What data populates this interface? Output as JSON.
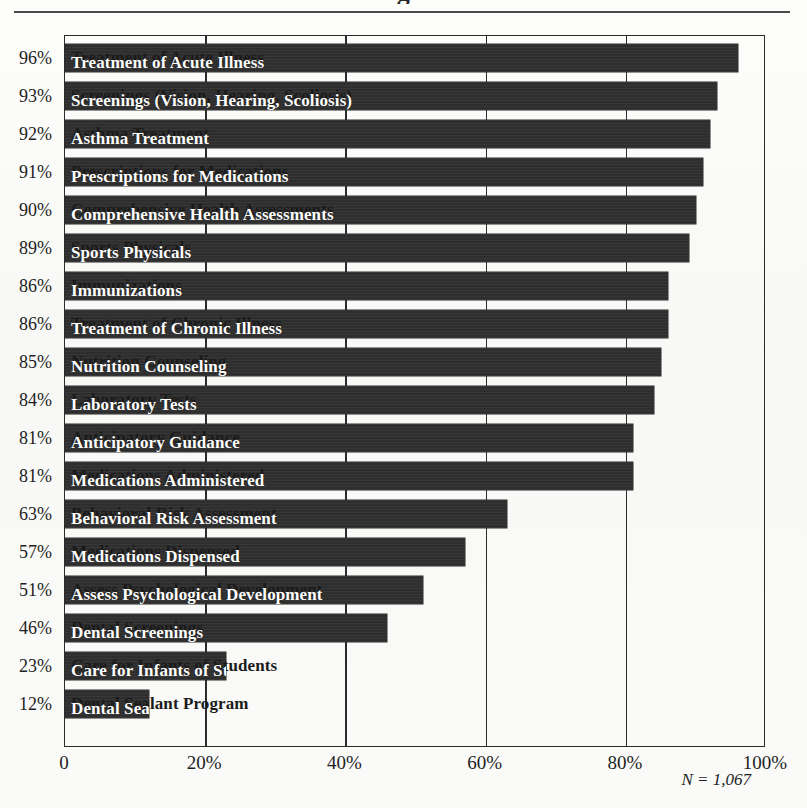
{
  "figure": {
    "title_clipped_glyph": "g",
    "n_note": "N = 1,067",
    "axis_max_label": "100%"
  },
  "chart_data": {
    "type": "bar",
    "orientation": "horizontal",
    "title": "",
    "xlabel": "",
    "ylabel": "",
    "xlim": [
      0,
      100
    ],
    "grid": true,
    "gridlines_at": [
      0,
      20,
      40,
      60,
      80,
      100
    ],
    "legend": "none",
    "annotation": "N = 1,067",
    "value_suffix": "%",
    "xticks": [
      "0",
      "20%",
      "40%",
      "60%",
      "80%",
      "100%"
    ],
    "xtick_values": [
      0,
      20,
      40,
      60,
      80,
      100
    ],
    "categories": [
      "Treatment of Acute Illness",
      "Screenings (Vision, Hearing, Scoliosis)",
      "Asthma Treatment",
      "Prescriptions for Medications",
      "Comprehensive Health Assessments",
      "Sports Physicals",
      "Immunizations",
      "Treatment of Chronic Illness",
      "Nutrition Counseling",
      "Laboratory Tests",
      "Anticipatory Guidance",
      "Medications Administered",
      "Behavioral Risk Assessment",
      "Medications Dispensed",
      "Assess Psychological Development",
      "Dental Screenings",
      "Care for Infants of Students",
      "Dental Sealant Program"
    ],
    "values": [
      96,
      93,
      92,
      91,
      90,
      89,
      86,
      86,
      85,
      84,
      81,
      81,
      63,
      57,
      51,
      46,
      23,
      12
    ],
    "value_labels": [
      "96%",
      "93%",
      "92%",
      "91%",
      "90%",
      "89%",
      "86%",
      "86%",
      "85%",
      "84%",
      "81%",
      "81%",
      "63%",
      "57%",
      "51%",
      "46%",
      "23%",
      "12%"
    ]
  },
  "colors": {
    "bar": "#2e2e2e",
    "axis": "#2b2b2b",
    "bar_text": "#ffffff",
    "paper": "#fbfbfa",
    "text": "#1f1f1f"
  }
}
